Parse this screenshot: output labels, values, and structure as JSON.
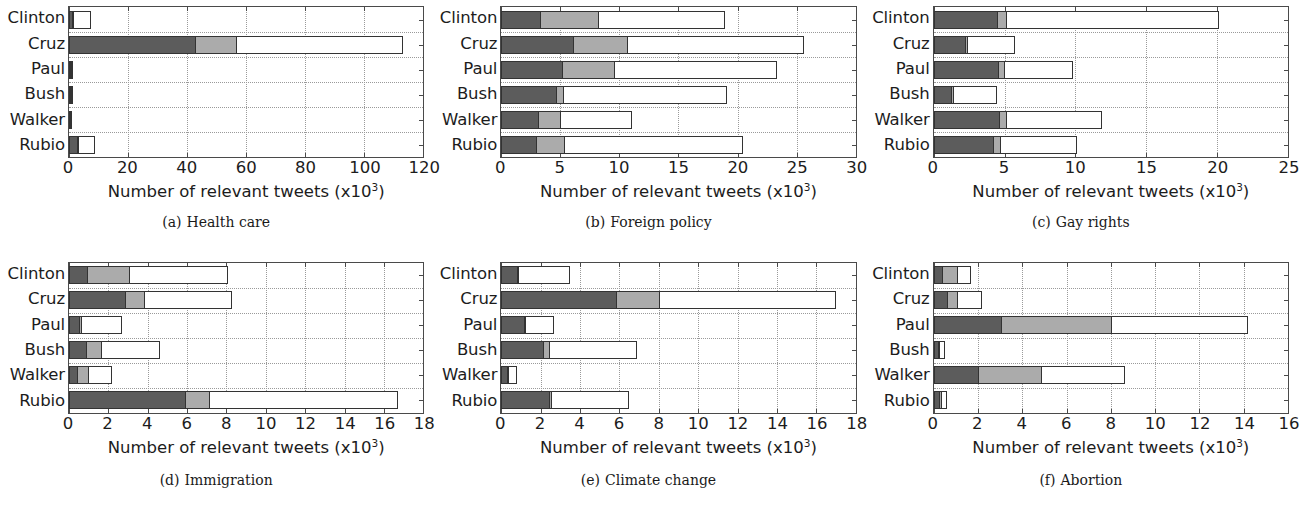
{
  "figure": {
    "rows": 2,
    "cols": 3,
    "axis_title": "Number of relevant tweets (x10",
    "axis_title_sup": "3",
    "axis_title_tail": ")",
    "colors": {
      "segment_1": "#5c5c5c",
      "segment_2": "#ababab",
      "segment_3": "#ffffff",
      "axis": "#4a4a4a",
      "grid": "#9a9a9a",
      "text": "#1c1c1c"
    }
  },
  "chart_data": [
    {
      "id": "panel-a",
      "type": "bar",
      "orientation": "horizontal",
      "stacked": true,
      "caption_label": "(a)",
      "caption_text": "Health care",
      "title": "Health care",
      "xlabel": "Number of relevant tweets (x10^3)",
      "ylabel": "",
      "categories": [
        "Clinton",
        "Cruz",
        "Paul",
        "Bush",
        "Walker",
        "Rubio"
      ],
      "xlim": [
        0,
        120
      ],
      "xticks": [
        0,
        20,
        40,
        60,
        80,
        100,
        120
      ],
      "xticklabels": [
        "0",
        "20",
        "40",
        "60",
        "80",
        "100",
        "120"
      ],
      "grid": true,
      "legend": "none",
      "series": [
        {
          "name": "segment 1",
          "values": [
            0.7,
            42.5,
            0.6,
            0.4,
            0.7,
            2.6
          ]
        },
        {
          "name": "segment 2",
          "values": [
            0.2,
            14.0,
            0.1,
            0.1,
            0.1,
            0.3
          ]
        },
        {
          "name": "segment 3",
          "values": [
            6.6,
            56.5,
            0.8,
            1.0,
            0.2,
            6.0
          ]
        }
      ],
      "totals": [
        7.5,
        113.0,
        1.5,
        1.5,
        1.0,
        8.9
      ]
    },
    {
      "id": "panel-b",
      "type": "bar",
      "orientation": "horizontal",
      "stacked": true,
      "caption_label": "(b)",
      "caption_text": "Foreign policy",
      "title": "Foreign policy",
      "xlabel": "Number of relevant tweets (x10^3)",
      "ylabel": "",
      "categories": [
        "Clinton",
        "Cruz",
        "Paul",
        "Bush",
        "Walker",
        "Rubio"
      ],
      "xlim": [
        0,
        30
      ],
      "xticks": [
        0,
        5,
        10,
        15,
        20,
        25,
        30
      ],
      "xticklabels": [
        "0",
        "5",
        "10",
        "15",
        "20",
        "25",
        "30"
      ],
      "grid": true,
      "legend": "none",
      "series": [
        {
          "name": "segment 1",
          "values": [
            3.2,
            6.0,
            5.1,
            4.6,
            3.1,
            2.9
          ]
        },
        {
          "name": "segment 2",
          "values": [
            5.0,
            4.6,
            4.4,
            0.6,
            1.9,
            2.4
          ]
        },
        {
          "name": "segment 3",
          "values": [
            10.7,
            15.0,
            13.8,
            13.9,
            6.1,
            15.2
          ]
        }
      ],
      "totals": [
        18.9,
        25.6,
        23.3,
        19.1,
        11.1,
        20.5
      ]
    },
    {
      "id": "panel-c",
      "type": "bar",
      "orientation": "horizontal",
      "stacked": true,
      "caption_label": "(c)",
      "caption_text": "Gay rights",
      "title": "Gay rights",
      "xlabel": "Number of relevant tweets (x10^3)",
      "ylabel": "",
      "categories": [
        "Clinton",
        "Cruz",
        "Paul",
        "Bush",
        "Walker",
        "Rubio"
      ],
      "xlim": [
        0,
        25
      ],
      "xticks": [
        0,
        5,
        10,
        15,
        20,
        25
      ],
      "xticklabels": [
        "0",
        "5",
        "10",
        "15",
        "20",
        "25"
      ],
      "grid": true,
      "legend": "none",
      "series": [
        {
          "name": "segment 1",
          "values": [
            4.4,
            2.2,
            4.5,
            1.2,
            4.6,
            4.2
          ]
        },
        {
          "name": "segment 2",
          "values": [
            0.7,
            0.15,
            0.5,
            0.15,
            0.5,
            0.5
          ]
        },
        {
          "name": "segment 3",
          "values": [
            15.0,
            3.4,
            4.8,
            3.1,
            6.8,
            5.4
          ]
        }
      ],
      "totals": [
        20.1,
        5.75,
        9.8,
        4.45,
        11.9,
        10.1
      ]
    },
    {
      "id": "panel-d",
      "type": "bar",
      "orientation": "horizontal",
      "stacked": true,
      "caption_label": "(d)",
      "caption_text": "Immigration",
      "title": "Immigration",
      "xlabel": "Number of relevant tweets (x10^3)",
      "ylabel": "",
      "categories": [
        "Clinton",
        "Cruz",
        "Paul",
        "Bush",
        "Walker",
        "Rubio"
      ],
      "xlim": [
        0,
        18
      ],
      "xticks": [
        0,
        2,
        4,
        6,
        8,
        10,
        12,
        14,
        16,
        18
      ],
      "xticklabels": [
        "0",
        "2",
        "4",
        "6",
        "8",
        "10",
        "12",
        "14",
        "16",
        "18"
      ],
      "grid": true,
      "legend": "none",
      "series": [
        {
          "name": "segment 1",
          "values": [
            0.85,
            2.85,
            0.5,
            0.85,
            0.35,
            5.9
          ]
        },
        {
          "name": "segment 2",
          "values": [
            2.2,
            0.95,
            0.1,
            0.75,
            0.6,
            1.2
          ]
        },
        {
          "name": "segment 3",
          "values": [
            5.05,
            4.5,
            2.1,
            3.0,
            1.25,
            9.6
          ]
        }
      ],
      "totals": [
        8.1,
        8.3,
        2.7,
        4.6,
        2.2,
        16.7
      ]
    },
    {
      "id": "panel-e",
      "type": "bar",
      "orientation": "horizontal",
      "stacked": true,
      "caption_label": "(e)",
      "caption_text": "Climate change",
      "title": "Climate change",
      "xlabel": "Number of relevant tweets (x10^3)",
      "ylabel": "",
      "categories": [
        "Clinton",
        "Cruz",
        "Paul",
        "Bush",
        "Walker",
        "Rubio"
      ],
      "xlim": [
        0,
        18
      ],
      "xticks": [
        0,
        2,
        4,
        6,
        8,
        10,
        12,
        14,
        16,
        18
      ],
      "xticklabels": [
        "0",
        "2",
        "4",
        "6",
        "8",
        "10",
        "12",
        "14",
        "16",
        "18"
      ],
      "grid": true,
      "legend": "none",
      "series": [
        {
          "name": "segment 1",
          "values": [
            0.75,
            5.8,
            1.15,
            2.1,
            0.3,
            2.4
          ]
        },
        {
          "name": "segment 2",
          "values": [
            0.05,
            2.2,
            0.05,
            0.3,
            0.05,
            0.1
          ]
        },
        {
          "name": "segment 3",
          "values": [
            2.7,
            9.0,
            1.5,
            4.5,
            0.45,
            4.0
          ]
        }
      ],
      "totals": [
        3.5,
        17.0,
        2.7,
        6.9,
        0.8,
        6.5
      ]
    },
    {
      "id": "panel-f",
      "type": "bar",
      "orientation": "horizontal",
      "stacked": true,
      "caption_label": "(f)",
      "caption_text": "Abortion",
      "title": "Abortion",
      "xlabel": "Number of relevant tweets (x10^3)",
      "ylabel": "",
      "categories": [
        "Clinton",
        "Cruz",
        "Paul",
        "Bush",
        "Walker",
        "Rubio"
      ],
      "xlim": [
        0,
        16
      ],
      "xticks": [
        0,
        2,
        4,
        6,
        8,
        10,
        12,
        14,
        16
      ],
      "xticklabels": [
        "0",
        "2",
        "4",
        "6",
        "8",
        "10",
        "12",
        "14",
        "16"
      ],
      "grid": true,
      "legend": "none",
      "series": [
        {
          "name": "segment 1",
          "values": [
            0.35,
            0.6,
            3.0,
            0.2,
            2.0,
            0.25
          ]
        },
        {
          "name": "segment 2",
          "values": [
            0.7,
            0.45,
            5.0,
            0.05,
            2.85,
            0.1
          ]
        },
        {
          "name": "segment 3",
          "values": [
            0.65,
            1.15,
            6.2,
            0.25,
            3.8,
            0.25
          ]
        }
      ],
      "totals": [
        1.7,
        2.2,
        14.2,
        0.5,
        8.65,
        0.6
      ]
    }
  ]
}
